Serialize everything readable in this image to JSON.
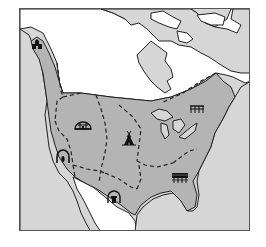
{
  "map": {
    "title": "",
    "description": "Outline map of North America showing Native American culture areas divided by dashed boundaries, each marked with a dwelling icon",
    "colors": {
      "ocean": "#d6d6d6",
      "culture_area": "#b4b4b4",
      "other_land": "#ffffff",
      "outline": "#222222",
      "frame": "#555555"
    },
    "culture_area_icons": [
      {
        "id": "northwest-coast",
        "icon": "plank-house-icon",
        "x": 36,
        "y": 44
      },
      {
        "id": "plateau",
        "icon": "earth-lodge-icon",
        "x": 82,
        "y": 125
      },
      {
        "id": "great-plains",
        "icon": "tipi-icon",
        "x": 128,
        "y": 138
      },
      {
        "id": "eastern-woodlands",
        "icon": "longhouse-frame-icon",
        "x": 196,
        "y": 108
      },
      {
        "id": "california-great-basin",
        "icon": "brush-shelter-icon",
        "x": 62,
        "y": 155
      },
      {
        "id": "southwest",
        "icon": "pueblo-icon",
        "x": 113,
        "y": 196
      },
      {
        "id": "southeast",
        "icon": "chickee-icon",
        "x": 179,
        "y": 176
      }
    ]
  }
}
